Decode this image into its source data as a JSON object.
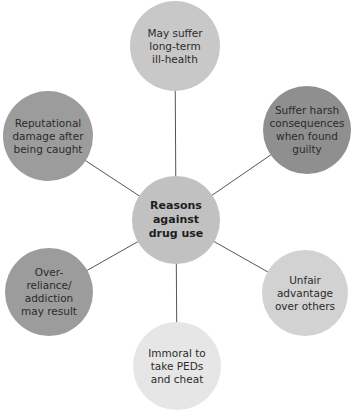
{
  "diagram": {
    "type": "spider",
    "center": {
      "label": "Reasons\nagainst\ndrug use",
      "color": "#c1c1c1",
      "x": 176,
      "y": 220,
      "r": 44
    },
    "nodes": [
      {
        "id": "top",
        "label": "May suffer\nlong-term\nill-health",
        "color": "#c8c8c8",
        "x": 175,
        "y": 46,
        "r": 45
      },
      {
        "id": "top-right",
        "label": "Suffer harsh\nconsequences\nwhen found\nguilty",
        "color": "#8f8f8f",
        "x": 307,
        "y": 130,
        "r": 44
      },
      {
        "id": "bottom-right",
        "label": "Unfair\nadvantage\nover others",
        "color": "#d2d2d2",
        "x": 305,
        "y": 293,
        "r": 43
      },
      {
        "id": "bottom",
        "label": "Immoral to\ntake PEDs\nand cheat",
        "color": "#e6e6e6",
        "x": 177,
        "y": 366,
        "r": 44
      },
      {
        "id": "bottom-left",
        "label": "Over-reliance/\naddiction\nmay result",
        "color": "#9c9c9c",
        "x": 49,
        "y": 292,
        "r": 44
      },
      {
        "id": "top-left",
        "label": "Reputational\ndamage after\nbeing caught",
        "color": "#9c9c9c",
        "x": 48,
        "y": 136,
        "r": 45
      }
    ],
    "link_color": "#555555"
  }
}
